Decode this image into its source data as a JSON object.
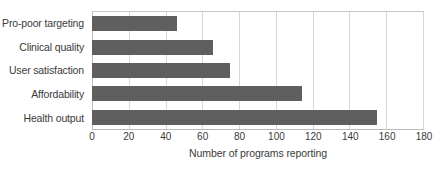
{
  "chart_data": {
    "type": "bar",
    "orientation": "horizontal",
    "title": "",
    "subtitle": "",
    "categories": [
      "Pro-poor targeting",
      "Clinical quality",
      "User satisfaction",
      "Affordability",
      "Health output"
    ],
    "values": [
      46,
      66,
      75,
      114,
      155
    ],
    "series": [
      {
        "name": "Number of programs reporting",
        "values": [
          46,
          66,
          75,
          114,
          155
        ]
      }
    ],
    "xlabel": "Number of programs reporting",
    "ylabel": "",
    "xlim": [
      0,
      180
    ],
    "xticks": [
      0,
      20,
      40,
      60,
      80,
      100,
      120,
      140,
      160,
      180
    ],
    "xtick_labels": [
      "0",
      "20",
      "40",
      "60",
      "80",
      "100",
      "120",
      "140",
      "160",
      "180"
    ],
    "grid": "vertical",
    "legend": "none",
    "annotations": [],
    "colors": {
      "bar": "#5f5f5f",
      "gridline": "#d6d6d6",
      "axis_line": "#bdbdbd",
      "text": "#3a3a3a",
      "background": "#ffffff"
    }
  }
}
